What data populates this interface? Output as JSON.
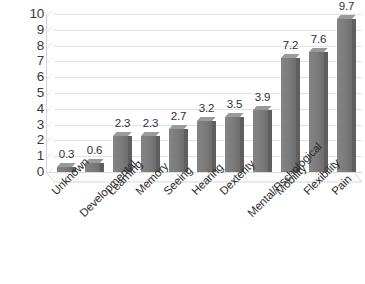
{
  "chart_data": {
    "type": "bar",
    "title": "",
    "subtitle": "",
    "xlabel": "",
    "ylabel": "",
    "categories": [
      "Unknown",
      "Developmental",
      "Learning",
      "Memory",
      "Seeing",
      "Hearing",
      "Dexterity",
      "Mental/Pschological",
      "Mobility",
      "Flexibility",
      "Pain"
    ],
    "values": [
      0.3,
      0.6,
      2.3,
      2.3,
      2.7,
      3.2,
      3.5,
      3.9,
      7.2,
      7.6,
      9.7
    ],
    "data_labels": [
      "0.3",
      "0.6",
      "2.3",
      "2.3",
      "2.7",
      "3.2",
      "3.5",
      "3.9",
      "7.2",
      "7.6",
      "9.7"
    ],
    "ylim": [
      0,
      10
    ],
    "y_ticks": [
      10,
      9,
      8,
      7,
      6,
      5,
      4,
      3,
      2,
      1,
      0
    ],
    "y_tick_labels": [
      "10",
      "9",
      "8",
      "7",
      "6",
      "5",
      "4",
      "3",
      "2",
      "1",
      "0"
    ],
    "grid": true,
    "grid_axis": "y",
    "legend": false,
    "legend_position": "none",
    "series": [
      {
        "name": "Series 1",
        "values": [
          0.3,
          0.6,
          2.3,
          2.3,
          2.7,
          3.2,
          3.5,
          3.9,
          7.2,
          7.6,
          9.7
        ]
      }
    ]
  },
  "style": {
    "bar_color": "#7d7d7d",
    "bar_side_color": "#5f5f5f",
    "bar_top_color": "#9a9a9a",
    "gridline_color": "#e3e3e3",
    "axis_color": "#d5d5d5",
    "text_color": "#2d2d2d",
    "background": "#ffffff"
  }
}
